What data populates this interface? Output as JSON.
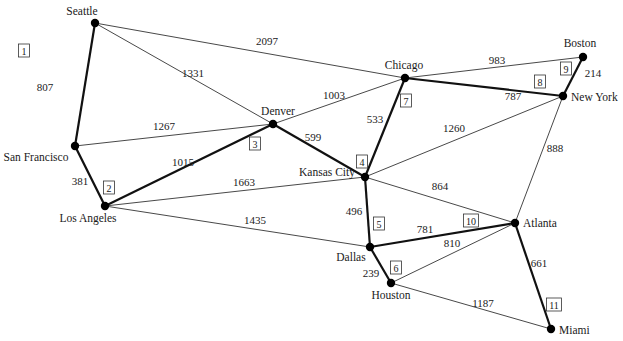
{
  "diagram": {
    "type": "weighted-graph",
    "colors": {
      "edge": "#333333",
      "tree_edge": "#111111",
      "node": "#000000",
      "background": "#ffffff"
    },
    "nodes": [
      {
        "id": "seattle",
        "label": "Seattle",
        "x": 95,
        "y": 23,
        "lx": 82,
        "ly": 15,
        "anchor": "middle"
      },
      {
        "id": "sanfrancisco",
        "label": "San Francisco",
        "x": 75,
        "y": 146,
        "lx": 36,
        "ly": 161,
        "anchor": "middle"
      },
      {
        "id": "losangeles",
        "label": "Los Angeles",
        "x": 105,
        "y": 206,
        "lx": 88,
        "ly": 222,
        "anchor": "middle"
      },
      {
        "id": "denver",
        "label": "Denver",
        "x": 273,
        "y": 124,
        "lx": 278,
        "ly": 115,
        "anchor": "middle"
      },
      {
        "id": "chicago",
        "label": "Chicago",
        "x": 405,
        "y": 78,
        "lx": 404,
        "ly": 69,
        "anchor": "middle"
      },
      {
        "id": "boston",
        "label": "Boston",
        "x": 583,
        "y": 57,
        "lx": 580,
        "ly": 47,
        "anchor": "middle"
      },
      {
        "id": "newyork",
        "label": "New York",
        "x": 563,
        "y": 96,
        "lx": 571,
        "ly": 101,
        "anchor": "start"
      },
      {
        "id": "kansascity",
        "label": "Kansas City",
        "x": 365,
        "y": 177,
        "lx": 327,
        "ly": 176,
        "anchor": "middle"
      },
      {
        "id": "dallas",
        "label": "Dallas",
        "x": 370,
        "y": 247,
        "lx": 351,
        "ly": 261,
        "anchor": "middle"
      },
      {
        "id": "houston",
        "label": "Houston",
        "x": 391,
        "y": 283,
        "lx": 391,
        "ly": 299,
        "anchor": "middle"
      },
      {
        "id": "atlanta",
        "label": "Atlanta",
        "x": 515,
        "y": 223,
        "lx": 523,
        "ly": 227,
        "anchor": "start"
      },
      {
        "id": "miami",
        "label": "Miami",
        "x": 551,
        "y": 329,
        "lx": 559,
        "ly": 334,
        "anchor": "start"
      }
    ],
    "edges": [
      {
        "from": "seattle",
        "to": "sanfrancisco",
        "weight": "807",
        "wx": 45,
        "wy": 91,
        "tree": true,
        "order": "1",
        "ox": 24,
        "oy": 51
      },
      {
        "from": "sanfrancisco",
        "to": "losangeles",
        "weight": "381",
        "wx": 80,
        "wy": 185,
        "tree": true,
        "order": "2",
        "ox": 109,
        "oy": 188
      },
      {
        "from": "losangeles",
        "to": "denver",
        "weight": "1015",
        "wx": 183,
        "wy": 166,
        "tree": true,
        "order": "3",
        "ox": 255,
        "oy": 144
      },
      {
        "from": "denver",
        "to": "kansascity",
        "weight": "599",
        "wx": 313,
        "wy": 141,
        "tree": true,
        "order": "4",
        "ox": 362,
        "oy": 162
      },
      {
        "from": "kansascity",
        "to": "dallas",
        "weight": "496",
        "wx": 354,
        "wy": 215,
        "tree": true,
        "order": "5",
        "ox": 379,
        "oy": 224
      },
      {
        "from": "dallas",
        "to": "houston",
        "weight": "239",
        "wx": 371,
        "wy": 277,
        "tree": true,
        "order": "6",
        "ox": 396,
        "oy": 268
      },
      {
        "from": "kansascity",
        "to": "chicago",
        "weight": "533",
        "wx": 375,
        "wy": 123,
        "tree": true,
        "order": "7",
        "ox": 406,
        "oy": 101
      },
      {
        "from": "chicago",
        "to": "newyork",
        "weight": "787",
        "wx": 513,
        "wy": 100,
        "tree": true,
        "order": "8",
        "ox": 540,
        "oy": 82
      },
      {
        "from": "newyork",
        "to": "boston",
        "weight": "214",
        "wx": 593,
        "wy": 77,
        "tree": true,
        "order": "9",
        "ox": 566,
        "oy": 69
      },
      {
        "from": "dallas",
        "to": "atlanta",
        "weight": "781",
        "wx": 425,
        "wy": 233,
        "tree": true,
        "order": "10",
        "ox": 471,
        "oy": 221
      },
      {
        "from": "atlanta",
        "to": "miami",
        "weight": "661",
        "wx": 539,
        "wy": 267,
        "tree": true,
        "order": "11",
        "ox": 554,
        "oy": 305
      },
      {
        "from": "seattle",
        "to": "chicago",
        "weight": "2097",
        "wx": 267,
        "wy": 45,
        "tree": false
      },
      {
        "from": "seattle",
        "to": "denver",
        "weight": "1331",
        "wx": 193,
        "wy": 77,
        "tree": false
      },
      {
        "from": "sanfrancisco",
        "to": "denver",
        "weight": "1267",
        "wx": 164,
        "wy": 130,
        "tree": false
      },
      {
        "from": "denver",
        "to": "chicago",
        "weight": "1003",
        "wx": 334,
        "wy": 99,
        "tree": false
      },
      {
        "from": "chicago",
        "to": "boston",
        "weight": "983",
        "wx": 497,
        "wy": 64,
        "tree": false
      },
      {
        "from": "kansascity",
        "to": "newyork",
        "weight": "1260",
        "wx": 454,
        "wy": 132,
        "tree": false
      },
      {
        "from": "newyork",
        "to": "atlanta",
        "weight": "888",
        "wx": 555,
        "wy": 152,
        "tree": false
      },
      {
        "from": "losangeles",
        "to": "kansascity",
        "weight": "1663",
        "wx": 244,
        "wy": 186,
        "tree": false
      },
      {
        "from": "losangeles",
        "to": "dallas",
        "weight": "1435",
        "wx": 255,
        "wy": 224,
        "tree": false
      },
      {
        "from": "kansascity",
        "to": "atlanta",
        "weight": "864",
        "wx": 440,
        "wy": 190,
        "tree": false
      },
      {
        "from": "houston",
        "to": "atlanta",
        "weight": "810",
        "wx": 452,
        "wy": 247,
        "tree": false
      },
      {
        "from": "houston",
        "to": "miami",
        "weight": "1187",
        "wx": 483,
        "wy": 307,
        "tree": false
      }
    ]
  }
}
